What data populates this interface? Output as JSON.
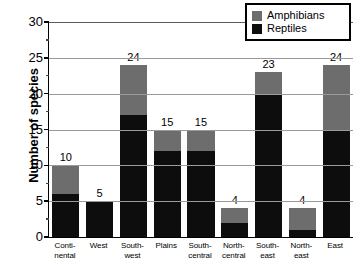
{
  "chart_data": {
    "type": "bar",
    "subtype": "stacked-bar",
    "title": "",
    "xlabel": "",
    "ylabel": "Number of species",
    "ylim": [
      0,
      30
    ],
    "yticks": [
      0,
      5,
      10,
      15,
      20,
      25,
      30
    ],
    "ytick_labels": [
      "0",
      "5",
      "10",
      "15",
      "20",
      "25",
      "30"
    ],
    "grid": "horizontal",
    "legend_position": "top-right",
    "categories": [
      "Continental",
      "West",
      "Southwest",
      "Plains",
      "South-central",
      "North-central",
      "Southeast",
      "Northeast",
      "East"
    ],
    "category_labels": [
      [
        "Conti-",
        "nental"
      ],
      [
        "West",
        ""
      ],
      [
        "South-",
        "west"
      ],
      [
        "Plains",
        ""
      ],
      [
        "South-",
        "central"
      ],
      [
        "North-",
        "central"
      ],
      [
        "South-",
        "east"
      ],
      [
        "North-",
        "east"
      ],
      [
        "East",
        ""
      ]
    ],
    "series": [
      {
        "name": "Reptiles",
        "color": "#0d0d0d",
        "values": [
          6,
          5,
          17,
          12,
          12,
          2,
          20,
          1,
          15
        ]
      },
      {
        "name": "Amphibians",
        "color": "#6d6d6d",
        "values": [
          4,
          0,
          7,
          3,
          3,
          2,
          3,
          3,
          9
        ]
      }
    ],
    "totals": [
      10,
      5,
      24,
      15,
      15,
      4,
      23,
      4,
      24
    ],
    "total_labels": [
      "10",
      "5",
      "24",
      "15",
      "15",
      "4",
      "23",
      "4",
      "24"
    ]
  },
  "legend": {
    "entries": [
      {
        "label": "Amphibians",
        "color": "#6d6d6d",
        "swatch": "legend-swatch-amphibians"
      },
      {
        "label": "Reptiles",
        "color": "#0d0d0d",
        "swatch": "legend-swatch-reptiles"
      }
    ]
  },
  "colors": {
    "reptiles": "#0d0d0d",
    "amphibians": "#6d6d6d",
    "axis": "#000000",
    "grid": "#9a9a9a",
    "background": "#ffffff"
  }
}
